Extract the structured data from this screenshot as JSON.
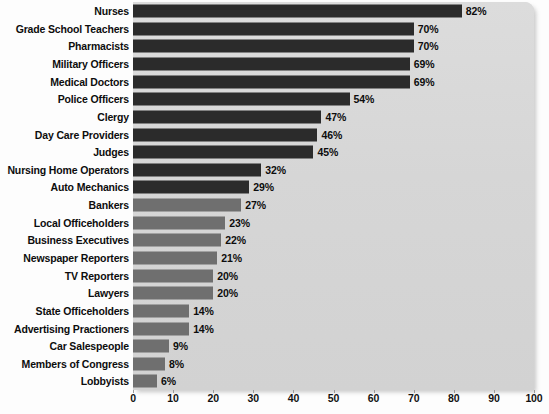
{
  "chart_data": {
    "type": "bar",
    "orientation": "horizontal",
    "title": "",
    "subtitle": "",
    "xlabel": "",
    "ylabel": "",
    "xlim": [
      0,
      100
    ],
    "xticks": [
      0,
      10,
      20,
      30,
      40,
      50,
      60,
      70,
      80,
      90,
      100
    ],
    "xtick_labels": [
      "0",
      "10",
      "20",
      "30",
      "40",
      "50",
      "60",
      "70",
      "80",
      "90",
      "100"
    ],
    "grid": false,
    "legend": null,
    "value_suffix": "%",
    "categories": [
      "Nurses",
      "Grade School Teachers",
      "Pharmacists",
      "Military Officers",
      "Medical Doctors",
      "Police Officers",
      "Clergy",
      "Day Care Providers",
      "Judges",
      "Nursing Home Operators",
      "Auto Mechanics",
      "Bankers",
      "Local Officeholders",
      "Business Executives",
      "Newspaper Reporters",
      "TV Reporters",
      "Lawyers",
      "State Officeholders",
      "Advertising Practioners",
      "Car Salespeople",
      "Members of Congress",
      "Lobbyists"
    ],
    "values": [
      82,
      70,
      70,
      69,
      69,
      54,
      47,
      46,
      45,
      32,
      29,
      27,
      23,
      22,
      21,
      20,
      20,
      14,
      14,
      9,
      8,
      6
    ],
    "value_labels": [
      "82%",
      "70%",
      "70%",
      "69%",
      "69%",
      "54%",
      "47%",
      "46%",
      "45%",
      "32%",
      "29%",
      "27%",
      "23%",
      "22%",
      "21%",
      "20%",
      "20%",
      "14%",
      "14%",
      "9%",
      "8%",
      "6%"
    ],
    "bar_shades": [
      "dark",
      "dark",
      "dark",
      "dark",
      "dark",
      "dark",
      "dark",
      "dark",
      "dark",
      "dark",
      "dark",
      "light",
      "light",
      "light",
      "light",
      "light",
      "light",
      "light",
      "light",
      "light",
      "light",
      "light"
    ],
    "colors": {
      "bar_dark": "#2b2b2b",
      "bar_light": "#6f6f6f",
      "plot_background": "#d9d9d9",
      "page_background": "#fdfdfd",
      "text": "#0d0d0d"
    }
  }
}
